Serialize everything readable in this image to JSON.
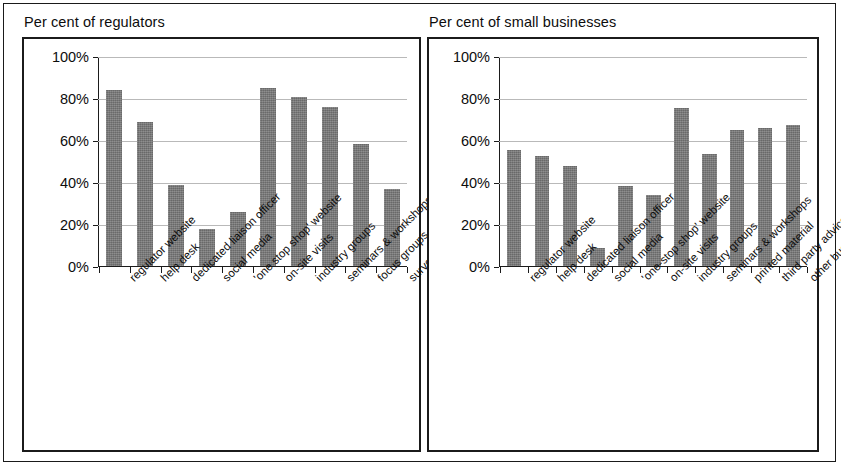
{
  "figure": {
    "panels": [
      {
        "title": "Per cent of regulators",
        "chart_index": 0
      },
      {
        "title": "Per cent of small businesses",
        "chart_index": 1
      }
    ]
  },
  "chart_data": [
    {
      "type": "bar",
      "title": "Per cent of regulators",
      "xlabel": "",
      "ylabel": "",
      "ylim": [
        0,
        100
      ],
      "ytick_labels": [
        "100%",
        "80%",
        "60%",
        "40%",
        "20%",
        "0%"
      ],
      "ytick_values": [
        100,
        80,
        60,
        40,
        20,
        0
      ],
      "grid": true,
      "legend": "none",
      "bar_color": "#767676",
      "categories": [
        "regulator website",
        "help desk",
        "dedicated liaison officer",
        "social media",
        "'one stop shop' website",
        "on-site visits",
        "industry groups",
        "seminars & workshops",
        "focus groups",
        "surveys"
      ],
      "values": [
        84,
        69,
        39,
        17.5,
        26,
        85,
        81,
        76,
        58.5,
        37
      ]
    },
    {
      "type": "bar",
      "title": "Per cent of small businesses",
      "xlabel": "",
      "ylabel": "",
      "ylim": [
        0,
        100
      ],
      "ytick_labels": [
        "100%",
        "80%",
        "60%",
        "40%",
        "20%",
        "0%"
      ],
      "ytick_values": [
        100,
        80,
        60,
        40,
        20,
        0
      ],
      "grid": true,
      "legend": "none",
      "bar_color": "#767676",
      "categories": [
        "regulator website",
        "help desk",
        "dedicated liaison officer",
        "social media",
        "'one-stop shop' website",
        "on-site visits",
        "industry groups",
        "seminars & workshops",
        "printed material",
        "third party advice/assistance",
        "other business owners"
      ],
      "values": [
        55.5,
        52.5,
        48,
        8.5,
        38.5,
        34,
        75.5,
        53.5,
        65,
        66,
        67.5
      ]
    }
  ]
}
